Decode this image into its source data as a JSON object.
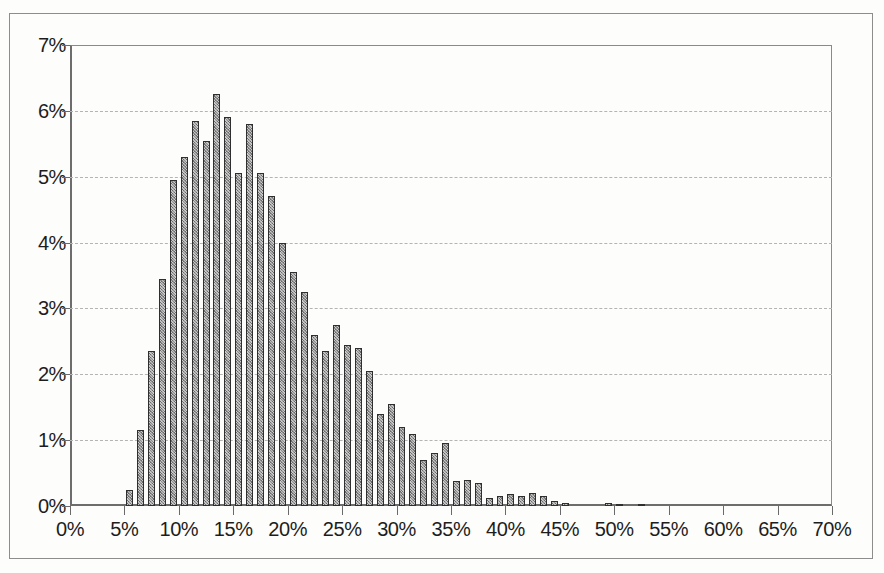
{
  "chart_data": {
    "type": "bar",
    "title": "",
    "subtitle": "",
    "xlabel": "",
    "ylabel": "",
    "xlim": [
      0,
      70
    ],
    "ylim": [
      0,
      7
    ],
    "grid": true,
    "legend": null,
    "bin_width": 1,
    "x_unit": "%",
    "y_unit": "%",
    "x_tick_labels": [
      "0%",
      "5%",
      "10%",
      "15%",
      "20%",
      "25%",
      "30%",
      "35%",
      "40%",
      "45%",
      "50%",
      "55%",
      "60%",
      "65%",
      "70%"
    ],
    "x_tick_values": [
      0,
      5,
      10,
      15,
      20,
      25,
      30,
      35,
      40,
      45,
      50,
      55,
      60,
      65,
      70
    ],
    "y_tick_labels": [
      "0%",
      "1%",
      "2%",
      "3%",
      "4%",
      "5%",
      "6%",
      "7%"
    ],
    "y_tick_values": [
      0,
      1,
      2,
      3,
      4,
      5,
      6,
      7
    ],
    "x": [
      5,
      6,
      7,
      8,
      9,
      10,
      11,
      12,
      13,
      14,
      15,
      16,
      17,
      18,
      19,
      20,
      21,
      22,
      23,
      24,
      25,
      26,
      27,
      28,
      29,
      30,
      31,
      32,
      33,
      34,
      35,
      36,
      37,
      38,
      39,
      40,
      41,
      42,
      43,
      44,
      45,
      46,
      47,
      48,
      49,
      50,
      51,
      52
    ],
    "categories": [
      "5%",
      "6%",
      "7%",
      "8%",
      "9%",
      "10%",
      "11%",
      "12%",
      "13%",
      "14%",
      "15%",
      "16%",
      "17%",
      "18%",
      "19%",
      "20%",
      "21%",
      "22%",
      "23%",
      "24%",
      "25%",
      "26%",
      "27%",
      "28%",
      "29%",
      "30%",
      "31%",
      "32%",
      "33%",
      "34%",
      "35%",
      "36%",
      "37%",
      "38%",
      "39%",
      "40%",
      "41%",
      "42%",
      "43%",
      "44%",
      "45%",
      "46%",
      "47%",
      "48%",
      "49%",
      "50%",
      "51%",
      "52%"
    ],
    "values": [
      0.25,
      1.15,
      2.35,
      3.45,
      4.95,
      5.3,
      5.85,
      5.55,
      6.25,
      5.9,
      5.05,
      5.8,
      5.05,
      4.7,
      4.0,
      3.55,
      3.25,
      2.6,
      2.35,
      2.75,
      2.45,
      2.4,
      2.05,
      1.4,
      1.55,
      1.2,
      1.1,
      0.7,
      0.8,
      0.95,
      0.38,
      0.4,
      0.35,
      0.12,
      0.15,
      0.18,
      0.15,
      0.2,
      0.15,
      0.08,
      0.05,
      0.0,
      0.0,
      0.0,
      0.04,
      0.03,
      0.0,
      0.03
    ]
  },
  "axis": {
    "y_title": "",
    "x_title": ""
  },
  "style": {
    "bar_fill": "#8e8e8e",
    "bar_outline": "#2f2f2f",
    "gridline_color": "#b4b4b4",
    "axis_color": "#6a6a6a",
    "background": "#fdfdfc"
  }
}
